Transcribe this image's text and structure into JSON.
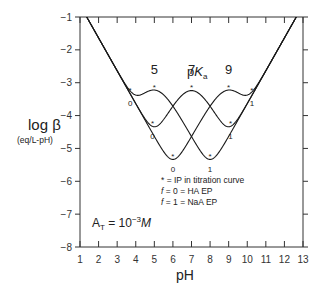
{
  "chart_data": {
    "type": "line",
    "title": "",
    "xlabel": "pH",
    "ylabel": "log β",
    "ylabel_units": "(eq/L-pH)",
    "xlim": [
      1,
      13
    ],
    "ylim": [
      -8,
      -1
    ],
    "x_ticks": [
      1,
      2,
      3,
      4,
      5,
      6,
      7,
      8,
      9,
      10,
      11,
      12,
      13
    ],
    "y_ticks": [
      -1,
      -2,
      -3,
      -4,
      -5,
      -6,
      -7,
      -8
    ],
    "grid": false,
    "total_concentration": "A_T = 10^-3 M",
    "total_concentration_log": -3,
    "pKa_header": "pKa",
    "series": [
      {
        "name": "pKa 9",
        "pKa": 9,
        "label": "9",
        "markers": [
          {
            "pH": 3.7,
            "logB": -3.35,
            "f": "0",
            "type": "EP"
          },
          {
            "pH": 9.0,
            "logB": -3.25,
            "type": "IP"
          },
          {
            "pH": 10.25,
            "logB": -3.35,
            "f": "1",
            "type": "EP"
          }
        ]
      },
      {
        "name": "pKa 7",
        "pKa": 7,
        "label": "7",
        "markers": [
          {
            "pH": 4.9,
            "logB": -4.35,
            "f": "0",
            "type": "EP"
          },
          {
            "pH": 7.0,
            "logB": -3.25,
            "type": "IP"
          },
          {
            "pH": 9.1,
            "logB": -4.35,
            "f": "1",
            "type": "EP"
          }
        ]
      },
      {
        "name": "pKa 5",
        "pKa": 5,
        "label": "5",
        "markers": [
          {
            "pH": 5.0,
            "logB": -3.25,
            "type": "IP"
          },
          {
            "pH": 6.0,
            "logB": -5.35,
            "f": "0",
            "type": "EP"
          },
          {
            "pH": 8.0,
            "logB": -5.35,
            "f": "1",
            "type": "EP"
          }
        ]
      }
    ],
    "approx_points": {
      "pKa 5": {
        "x": [
          1,
          2,
          3,
          4,
          4.5,
          5,
          5.5,
          6,
          7,
          8,
          9,
          10,
          11,
          12,
          13
        ],
        "y": [
          -0.64,
          -1.64,
          -2.62,
          -3.27,
          -3.34,
          -3.24,
          -3.58,
          -4.34,
          -5.0,
          -5.34,
          -4.6,
          -3.64,
          -2.64,
          -1.64,
          -0.64
        ]
      },
      "pKa 7": {
        "x": [
          1,
          2,
          3,
          4,
          5,
          6,
          7,
          8,
          9,
          10,
          11,
          12,
          13
        ],
        "y": [
          -0.64,
          -1.64,
          -2.64,
          -3.63,
          -4.34,
          -3.97,
          -3.24,
          -3.97,
          -4.34,
          -3.63,
          -2.64,
          -1.64,
          -0.64
        ]
      },
      "pKa 9": {
        "x": [
          1,
          2,
          3,
          4,
          5,
          6,
          7,
          8,
          9,
          9.5,
          10,
          11,
          12,
          13
        ],
        "y": [
          -0.64,
          -1.64,
          -2.64,
          -3.64,
          -4.6,
          -5.34,
          -5.0,
          -4.34,
          -3.24,
          -3.58,
          -3.34,
          -2.62,
          -1.64,
          -0.64
        ]
      }
    },
    "legend": [
      "* = IP in titration curve",
      "f = 0 = HA EP",
      "f = 1 = NaA EP"
    ],
    "legend_position": "inside, lower-right of center"
  },
  "labels": {
    "ylabel_main": "log β",
    "ylabel_units": "(eq/L-pH)",
    "xlabel": "pH",
    "pka_title_p": "p",
    "pka_title_K": "K",
    "pka_title_sub": "a",
    "at_A": "A",
    "at_sub": "T",
    "at_eq": " = 10",
    "at_exp": "−3",
    "at_unit": "M",
    "legend_line1": "* = IP in titration curve",
    "legend_line2_f": "f",
    "legend_line2_rest": " = 0 = HA EP",
    "legend_line3_f": "f",
    "legend_line3_rest": " = 1 = NaA EP"
  },
  "colors": {
    "line": "#1a1a1a",
    "axis": "#333333",
    "background": "#ffffff"
  }
}
